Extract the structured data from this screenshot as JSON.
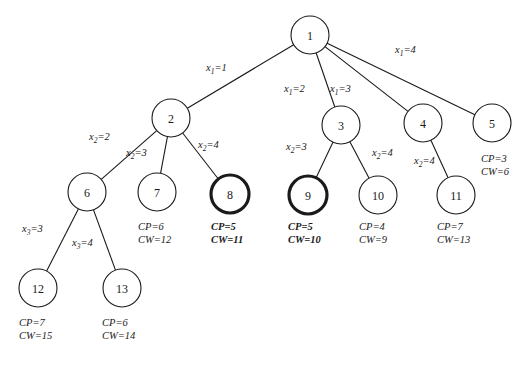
{
  "figure": {
    "type": "search-tree-diagram",
    "width": 529,
    "height": 366,
    "background_color": "#ffffff",
    "line_color": "#1a1a1a",
    "highlight_style": "thick-circle-outline-and-bold-text"
  },
  "nodes": [
    {
      "id": "n1",
      "label": "1",
      "cx": 310,
      "cy": 35,
      "r": 19,
      "emphasis": "normal"
    },
    {
      "id": "n2",
      "label": "2",
      "cx": 171,
      "cy": 118,
      "r": 19,
      "emphasis": "normal"
    },
    {
      "id": "n3",
      "label": "3",
      "cx": 341,
      "cy": 125,
      "r": 19,
      "emphasis": "normal"
    },
    {
      "id": "n4",
      "label": "4",
      "cx": 423,
      "cy": 123,
      "r": 19,
      "emphasis": "normal"
    },
    {
      "id": "n5",
      "label": "5",
      "cx": 492,
      "cy": 123,
      "r": 19,
      "emphasis": "normal"
    },
    {
      "id": "n6",
      "label": "6",
      "cx": 87,
      "cy": 192,
      "r": 19,
      "emphasis": "normal"
    },
    {
      "id": "n7",
      "label": "7",
      "cx": 157,
      "cy": 192,
      "r": 19,
      "emphasis": "normal"
    },
    {
      "id": "n8",
      "label": "8",
      "cx": 230,
      "cy": 194,
      "r": 19,
      "emphasis": "bold"
    },
    {
      "id": "n9",
      "label": "9",
      "cx": 308,
      "cy": 195,
      "r": 19,
      "emphasis": "bold"
    },
    {
      "id": "n10",
      "label": "10",
      "cx": 378,
      "cy": 195,
      "r": 19,
      "emphasis": "normal"
    },
    {
      "id": "n11",
      "label": "11",
      "cx": 456,
      "cy": 195,
      "r": 19,
      "emphasis": "normal"
    },
    {
      "id": "n12",
      "label": "12",
      "cx": 38,
      "cy": 288,
      "r": 19,
      "emphasis": "normal"
    },
    {
      "id": "n13",
      "label": "13",
      "cx": 122,
      "cy": 288,
      "r": 19,
      "emphasis": "normal"
    }
  ],
  "edges": [
    {
      "id": "e1-2",
      "from": "n1",
      "to": "n2",
      "label_var": "x",
      "label_sub": "1",
      "label_val": "1"
    },
    {
      "id": "e1-3",
      "from": "n1",
      "to": "n3",
      "label_var": "x",
      "label_sub": "1",
      "label_val": "2"
    },
    {
      "id": "e1-4",
      "from": "n1",
      "to": "n4",
      "label_var": "x",
      "label_sub": "1",
      "label_val": "3"
    },
    {
      "id": "e1-5",
      "from": "n1",
      "to": "n5",
      "label_var": "x",
      "label_sub": "1",
      "label_val": "4"
    },
    {
      "id": "e2-6",
      "from": "n2",
      "to": "n6",
      "label_var": "x",
      "label_sub": "2",
      "label_val": "2"
    },
    {
      "id": "e2-7",
      "from": "n2",
      "to": "n7",
      "label_var": "x",
      "label_sub": "2",
      "label_val": "3"
    },
    {
      "id": "e2-8",
      "from": "n2",
      "to": "n8",
      "label_var": "x",
      "label_sub": "2",
      "label_val": "4"
    },
    {
      "id": "e3-9",
      "from": "n3",
      "to": "n9",
      "label_var": "x",
      "label_sub": "2",
      "label_val": "3"
    },
    {
      "id": "e3-10",
      "from": "n3",
      "to": "n10",
      "label_var": "x",
      "label_sub": "2",
      "label_val": "4"
    },
    {
      "id": "e4-11",
      "from": "n4",
      "to": "n11",
      "label_var": "x",
      "label_sub": "2",
      "label_val": "4"
    },
    {
      "id": "e6-12",
      "from": "n6",
      "to": "n12",
      "label_var": "x",
      "label_sub": "3",
      "label_val": "3"
    },
    {
      "id": "e6-13",
      "from": "n6",
      "to": "n13",
      "label_var": "x",
      "label_sub": "3",
      "label_val": "4"
    }
  ],
  "edge_labels": [
    {
      "id": "lb1",
      "for_edge": "e1-2",
      "text_var": "x",
      "text_sub": "1",
      "text_val": "=1",
      "x": 206,
      "y": 63
    },
    {
      "id": "lb2",
      "for_edge": "e1-3",
      "text_var": "x",
      "text_sub": "1",
      "text_val": "=2",
      "x": 284,
      "y": 84
    },
    {
      "id": "lb3",
      "for_edge": "e1-4",
      "text_var": "x",
      "text_sub": "1",
      "text_val": "=3",
      "x": 330,
      "y": 84
    },
    {
      "id": "lb4",
      "for_edge": "e1-5",
      "text_var": "x",
      "text_sub": "1",
      "text_val": "=4",
      "x": 395,
      "y": 45
    },
    {
      "id": "lb5",
      "for_edge": "e2-6",
      "text_var": "x",
      "text_sub": "2",
      "text_val": "=2",
      "x": 89,
      "y": 132
    },
    {
      "id": "lb6",
      "for_edge": "e2-7",
      "text_var": "x",
      "text_sub": "2",
      "text_val": "=3",
      "x": 126,
      "y": 148
    },
    {
      "id": "lb7",
      "for_edge": "e2-8",
      "text_var": "x",
      "text_sub": "2",
      "text_val": "=4",
      "x": 198,
      "y": 140
    },
    {
      "id": "lb8",
      "for_edge": "e3-9",
      "text_var": "x",
      "text_sub": "2",
      "text_val": "=3",
      "x": 286,
      "y": 142
    },
    {
      "id": "lb9",
      "for_edge": "e3-10",
      "text_var": "x",
      "text_sub": "2",
      "text_val": "=4",
      "x": 372,
      "y": 148
    },
    {
      "id": "lb10",
      "for_edge": "e4-11",
      "text_var": "x",
      "text_sub": "2",
      "text_val": "=4",
      "x": 414,
      "y": 156
    },
    {
      "id": "lb11",
      "for_edge": "e6-12",
      "text_var": "x",
      "text_sub": "3",
      "text_val": "=3",
      "x": 22,
      "y": 224
    },
    {
      "id": "lb12",
      "for_edge": "e6-13",
      "text_var": "x",
      "text_sub": "3",
      "text_val": "=4",
      "x": 72,
      "y": 238
    }
  ],
  "cost_annotations": [
    {
      "id": "c5",
      "for_node": "n5",
      "cp": "CP=3",
      "cw": "CW=6",
      "x": 481,
      "y": 153,
      "bold": false
    },
    {
      "id": "c7",
      "for_node": "n7",
      "cp": "CP=6",
      "cw": "CW=12",
      "x": 138,
      "y": 221,
      "bold": false
    },
    {
      "id": "c8",
      "for_node": "n8",
      "cp": "CP=5",
      "cw": "CW=11",
      "x": 211,
      "y": 221,
      "bold": true
    },
    {
      "id": "c9",
      "for_node": "n9",
      "cp": "CP=5",
      "cw": "CW=10",
      "x": 288,
      "y": 221,
      "bold": true
    },
    {
      "id": "c10",
      "for_node": "n10",
      "cp": "CP=4",
      "cw": "CW=9",
      "x": 359,
      "y": 221,
      "bold": false
    },
    {
      "id": "c11",
      "for_node": "n11",
      "cp": "CP=7",
      "cw": "CW=13",
      "x": 437,
      "y": 221,
      "bold": false
    },
    {
      "id": "c12",
      "for_node": "n12",
      "cp": "CP=7",
      "cw": "CW=15",
      "x": 19,
      "y": 317,
      "bold": false
    },
    {
      "id": "c13",
      "for_node": "n13",
      "cp": "CP=6",
      "cw": "CW=14",
      "x": 102,
      "y": 317,
      "bold": false
    }
  ]
}
